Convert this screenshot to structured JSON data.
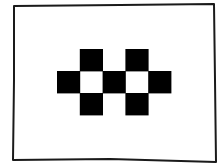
{
  "diagram": {
    "frame": {
      "points": [
        [
          14,
          6
        ],
        [
          120,
          5
        ],
        [
          214,
          4
        ],
        [
          215,
          80
        ],
        [
          216,
          162
        ],
        [
          110,
          159
        ],
        [
          13,
          160
        ],
        [
          14,
          80
        ]
      ],
      "stroke": "#1a1a1a",
      "stroke_width": 2
    },
    "grid": {
      "origin_x": 57,
      "origin_y": 49,
      "cell_w": 22.8,
      "cell_h": 22,
      "cols": 5,
      "rows": 3,
      "fill_color": "#000000",
      "empty_color": "#ffffff",
      "cells": [
        [
          0,
          1,
          0,
          1,
          0
        ],
        [
          1,
          0,
          1,
          0,
          1
        ],
        [
          0,
          1,
          0,
          1,
          0
        ]
      ]
    }
  }
}
